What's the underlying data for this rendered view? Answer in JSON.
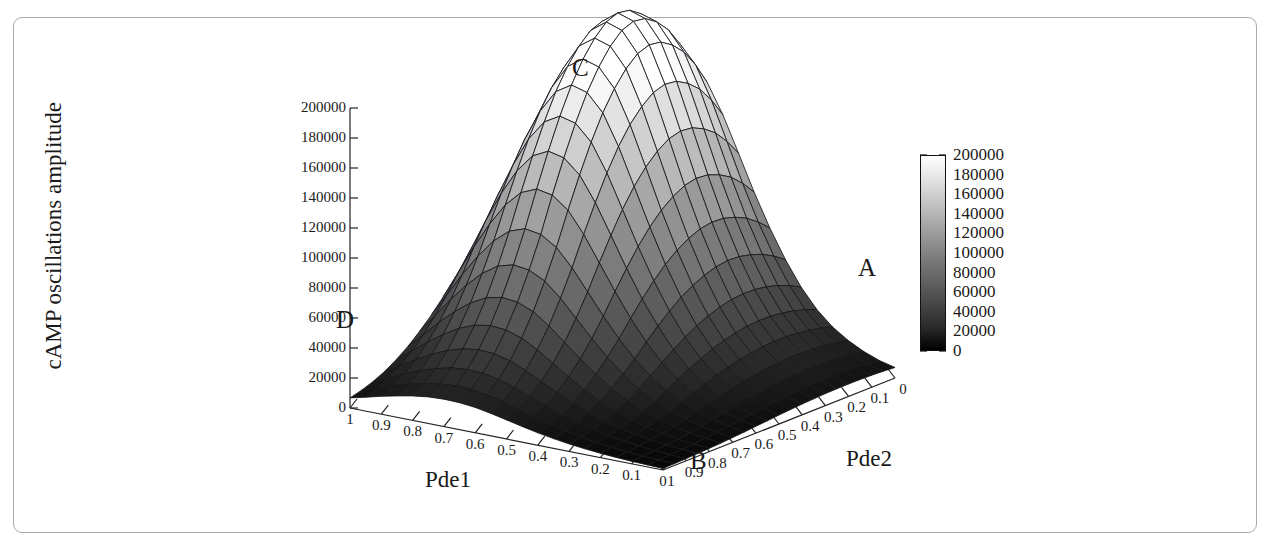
{
  "figure": {
    "background": "#ffffff",
    "frame_color": "#a9a9a9"
  },
  "chart_data": {
    "type": "surface",
    "title": "",
    "zlabel": "cAMP oscillations amplitude",
    "xlabel": "Pde1",
    "ylabel": "Pde2",
    "zlim": [
      0,
      200000
    ],
    "z_ticks": [
      0,
      20000,
      40000,
      60000,
      80000,
      100000,
      120000,
      140000,
      160000,
      180000,
      200000
    ],
    "z_tick_labels": [
      "0",
      "20000",
      "40000",
      "60000",
      "80000",
      "100000",
      "120000",
      "140000",
      "160000",
      "180000",
      "200000"
    ],
    "x_ticks": [
      1,
      0.9,
      0.8,
      0.7,
      0.6,
      0.5,
      0.4,
      0.3,
      0.2,
      0.1,
      0
    ],
    "x_tick_labels": [
      "1",
      "0.9",
      "0.8",
      "0.7",
      "0.6",
      "0.5",
      "0.4",
      "0.3",
      "0.2",
      "0.1",
      "0"
    ],
    "y_ticks": [
      1,
      0.9,
      0.8,
      0.7,
      0.6,
      0.5,
      0.4,
      0.3,
      0.2,
      0.1,
      0
    ],
    "y_tick_labels": [
      "1",
      "0.9",
      "0.8",
      "0.7",
      "0.6",
      "0.5",
      "0.4",
      "0.3",
      "0.2",
      "0.1",
      "0"
    ],
    "colormap": "grayscale_black_to_white",
    "colorbar": {
      "min": 0,
      "max": 200000,
      "ticks": [
        0,
        20000,
        40000,
        60000,
        80000,
        100000,
        120000,
        140000,
        160000,
        180000,
        200000
      ],
      "tick_labels": [
        "0",
        "20000",
        "40000",
        "60000",
        "80000",
        "100000",
        "120000",
        "140000",
        "160000",
        "180000",
        "200000"
      ]
    },
    "corner_annotations": [
      {
        "label": "A",
        "position": "right",
        "description": "low amplitude corner"
      },
      {
        "label": "B",
        "position": "front",
        "description": "low amplitude corner"
      },
      {
        "label": "C",
        "position": "peak",
        "description": "maximum amplitude peak"
      },
      {
        "label": "D",
        "position": "left",
        "description": "low amplitude corner"
      }
    ],
    "grid_size": [
      21,
      21
    ],
    "z_values": [
      [
        1000,
        1200,
        1500,
        1800,
        2200,
        2600,
        3200,
        3800,
        4600,
        5200,
        6000,
        6600,
        7200,
        7600,
        8000,
        8200,
        8300,
        8200,
        8000,
        7600,
        7000
      ],
      [
        1300,
        1600,
        2000,
        2500,
        3100,
        3800,
        4700,
        5600,
        6700,
        7600,
        8600,
        9400,
        10200,
        10800,
        11200,
        11400,
        11500,
        11300,
        11000,
        10400,
        9600
      ],
      [
        1700,
        2100,
        2700,
        3400,
        4300,
        5300,
        6600,
        8000,
        9600,
        11000,
        12400,
        13600,
        14600,
        15400,
        16000,
        16300,
        16300,
        16000,
        15500,
        14700,
        13600
      ],
      [
        2200,
        2800,
        3600,
        4600,
        5900,
        7400,
        9200,
        11200,
        13500,
        15500,
        17500,
        19200,
        20600,
        21700,
        22400,
        22800,
        22800,
        22300,
        21600,
        20400,
        18900
      ],
      [
        2900,
        3700,
        4800,
        6200,
        8000,
        10100,
        12600,
        15400,
        18600,
        21500,
        24200,
        26600,
        28500,
        30000,
        31000,
        31500,
        31400,
        30800,
        29700,
        28000,
        25900
      ],
      [
        3800,
        4900,
        6400,
        8300,
        10800,
        13700,
        17200,
        21100,
        25500,
        29500,
        33300,
        36600,
        39200,
        41200,
        42600,
        43200,
        43000,
        42100,
        40600,
        38300,
        35400
      ],
      [
        5000,
        6500,
        8500,
        11100,
        14500,
        18500,
        23300,
        28700,
        34700,
        40300,
        45500,
        50000,
        53600,
        56400,
        58300,
        59100,
        58800,
        57500,
        55400,
        52200,
        48200
      ],
      [
        6500,
        8500,
        11200,
        14700,
        19200,
        24600,
        31000,
        38200,
        46300,
        53800,
        60800,
        66900,
        71700,
        75400,
        78000,
        79100,
        78700,
        76900,
        74100,
        69800,
        64400
      ],
      [
        8300,
        10900,
        14400,
        18900,
        24800,
        31800,
        40100,
        49500,
        60000,
        69800,
        78900,
        86800,
        93100,
        97900,
        101300,
        102700,
        102100,
        99800,
        96100,
        90500,
        83500
      ],
      [
        10400,
        13700,
        18100,
        23800,
        31200,
        40100,
        50600,
        62500,
        75800,
        88200,
        99700,
        109700,
        117700,
        123800,
        128100,
        129800,
        129100,
        126100,
        121400,
        114300,
        105400
      ],
      [
        12700,
        16700,
        22100,
        29100,
        38200,
        49100,
        62000,
        76600,
        92900,
        108200,
        122300,
        134600,
        144400,
        151900,
        157200,
        159300,
        158400,
        154700,
        148900,
        140200,
        129200
      ],
      [
        15000,
        19700,
        26100,
        34400,
        45100,
        58000,
        73300,
        90500,
        109800,
        127900,
        144600,
        159100,
        170700,
        179600,
        185900,
        188400,
        187300,
        182900,
        176000,
        165700,
        152700
      ],
      [
        16900,
        22300,
        29500,
        38800,
        50900,
        65400,
        82700,
        102100,
        123800,
        144300,
        163100,
        179500,
        192600,
        202700,
        209800,
        212600,
        211400,
        206400,
        198600,
        187000,
        172300
      ],
      [
        18000,
        23700,
        31400,
        41300,
        54200,
        69600,
        88000,
        108700,
        131800,
        153600,
        173600,
        191000,
        205000,
        215700,
        223300,
        226300,
        225000,
        219700,
        211400,
        199000,
        183400
      ],
      [
        18300,
        24100,
        31900,
        42000,
        55100,
        70800,
        89400,
        110400,
        133800,
        156000,
        176300,
        194000,
        208200,
        219100,
        226800,
        229800,
        228500,
        223100,
        214700,
        202100,
        186300
      ],
      [
        17700,
        23300,
        30900,
        40600,
        53300,
        68400,
        86500,
        106800,
        129400,
        150800,
        170400,
        187500,
        201200,
        211700,
        219100,
        222100,
        220800,
        215600,
        207400,
        195300,
        180000
      ],
      [
        16300,
        21500,
        28400,
        37400,
        49100,
        63000,
        79600,
        98300,
        119200,
        138800,
        156900,
        172500,
        185200,
        194900,
        201800,
        204500,
        203300,
        198500,
        191000,
        179800,
        165800
      ],
      [
        14300,
        18800,
        24900,
        32800,
        43000,
        55300,
        69800,
        86200,
        104500,
        121800,
        137500,
        151200,
        162400,
        170900,
        176800,
        179200,
        178100,
        174000,
        167300,
        157600,
        145300
      ],
      [
        11900,
        15700,
        20700,
        27300,
        35800,
        46000,
        58100,
        71800,
        87100,
        101400,
        114600,
        125900,
        135200,
        142400,
        147200,
        149300,
        148400,
        144900,
        139400,
        131200,
        121000
      ],
      [
        9300,
        12200,
        16100,
        21300,
        27900,
        35900,
        45400,
        56100,
        68100,
        79300,
        89500,
        98500,
        105700,
        111300,
        115200,
        116800,
        116200,
        113400,
        109100,
        102700,
        94700
      ],
      [
        6700,
        8800,
        11600,
        15300,
        20100,
        25800,
        32700,
        40400,
        49100,
        57100,
        64500,
        71000,
        76200,
        80200,
        83100,
        84200,
        83800,
        81800,
        78700,
        74000,
        68300
      ]
    ],
    "peak_value": 229800,
    "peak_label": "C"
  }
}
